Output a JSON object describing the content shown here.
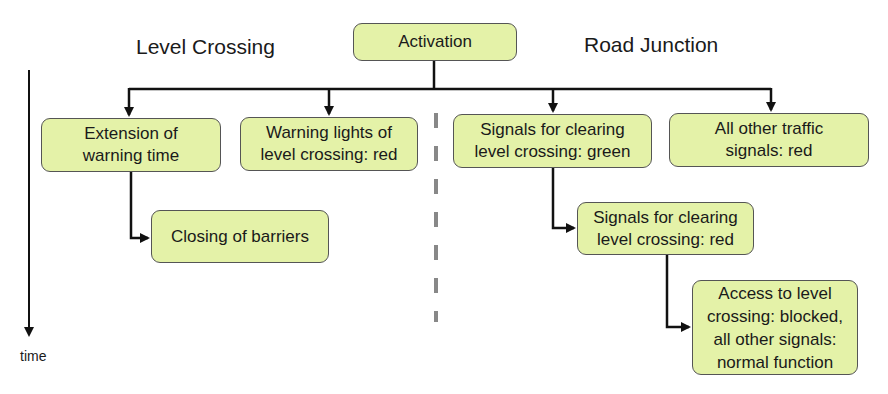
{
  "headings": {
    "left": "Level Crossing",
    "right": "Road Junction"
  },
  "axis": {
    "time_label": "time"
  },
  "nodes": {
    "activation": "Activation",
    "extension": "Extension of\nwarning time",
    "warning_lights": "Warning lights of\nlevel crossing: red",
    "closing_barriers": "Closing of barriers",
    "signals_green": "Signals for clearing\nlevel crossing: green",
    "all_other_red": "All other traffic\nsignals: red",
    "signals_red": "Signals for clearing\nlevel crossing: red",
    "access_blocked": "Access to level\ncrossing: blocked,\nall other signals:\nnormal function"
  },
  "colors": {
    "box_fill": "#e4f2a8",
    "box_border": "#555555",
    "line": "#111111",
    "divider": "#888888"
  }
}
